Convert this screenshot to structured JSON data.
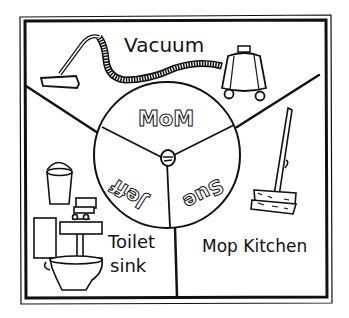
{
  "illustration": {
    "type": "chore-wheel",
    "style": "hand-drawn black ink on white",
    "colors": {
      "ink": "#111111",
      "paper": "#ffffff"
    },
    "wheel": {
      "segments": [
        {
          "name": "MoM",
          "position": "top"
        },
        {
          "name": "Jeff",
          "position": "bottom-left",
          "orientation": "upside-down"
        },
        {
          "name": "Sue",
          "position": "bottom-right",
          "orientation": "upside-down"
        }
      ],
      "center": "spinner-pin"
    },
    "chores": [
      {
        "label": "Vacuum",
        "region": "top",
        "icon": "vacuum-cleaner-icon"
      },
      {
        "label": "Toilet",
        "label2": "sink",
        "region": "bottom-left",
        "icon": "toilet-sink-bucket-icon"
      },
      {
        "label": "Mop Kitchen",
        "region": "bottom-right",
        "icon": "mop-icon"
      }
    ]
  }
}
